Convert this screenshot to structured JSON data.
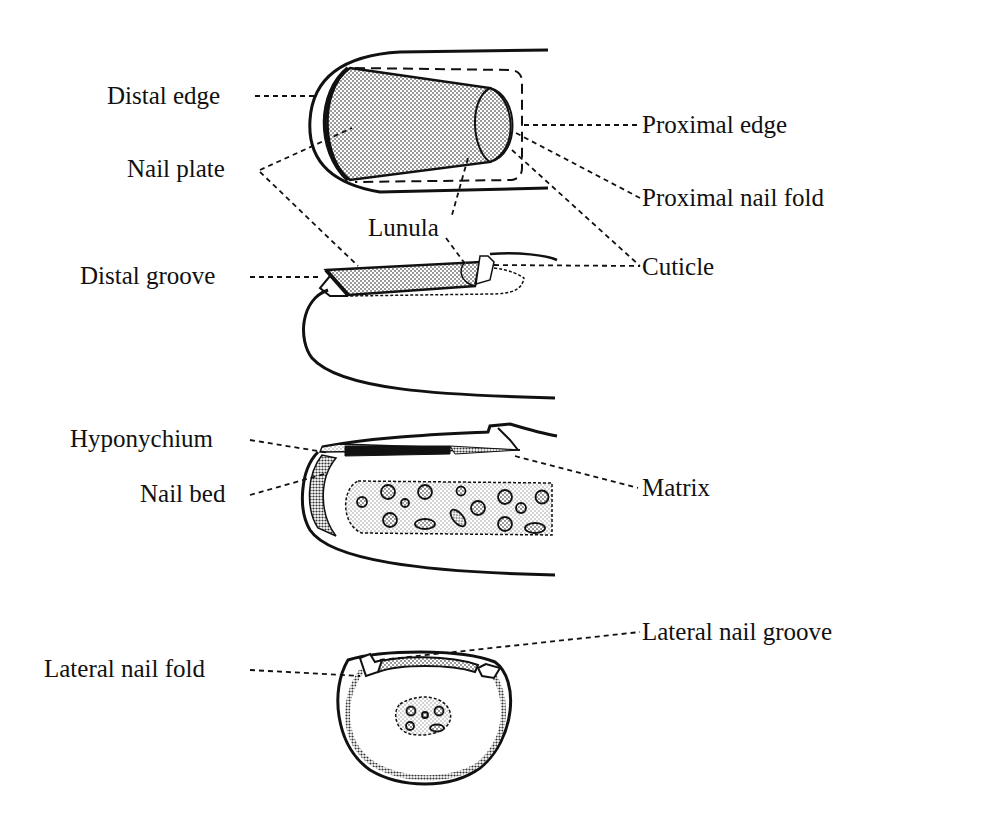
{
  "figure": {
    "views": [
      {
        "id": "top-view",
        "description": "Dorsal view of fingertip"
      },
      {
        "id": "side-view",
        "description": "Lateral view of fingertip"
      },
      {
        "id": "longitudinal-section",
        "description": "Longitudinal section of fingertip"
      },
      {
        "id": "cross-section",
        "description": "Transverse section of fingertip"
      }
    ]
  },
  "labels": {
    "distal_edge": "Distal edge",
    "nail_plate": "Nail plate",
    "proximal_edge": "Proximal edge",
    "proximal_nail_fold": "Proximal nail fold",
    "lunula": "Lunula",
    "distal_groove": "Distal groove",
    "cuticle": "Cuticle",
    "hyponychium": "Hyponychium",
    "nail_bed": "Nail bed",
    "matrix": "Matrix",
    "lateral_nail_groove": "Lateral nail groove",
    "lateral_nail_fold": "Lateral nail fold"
  },
  "colors": {
    "ink": "#111111",
    "stipple": "#9a9a9a",
    "background": "#ffffff"
  }
}
